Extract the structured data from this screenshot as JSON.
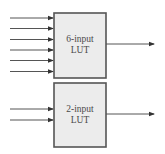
{
  "diagram": {
    "blocks": [
      {
        "id": "lut6",
        "label_line1": "6-input",
        "label_line2": "LUT",
        "inputs": 6,
        "outputs": 1
      },
      {
        "id": "lut2",
        "label_line1": "2-input",
        "label_line2": "LUT",
        "inputs": 2,
        "outputs": 1
      }
    ],
    "colors": {
      "box_fill": "#ececec",
      "box_stroke": "#555555",
      "line": "#444444",
      "text": "#4a4a4a"
    }
  }
}
